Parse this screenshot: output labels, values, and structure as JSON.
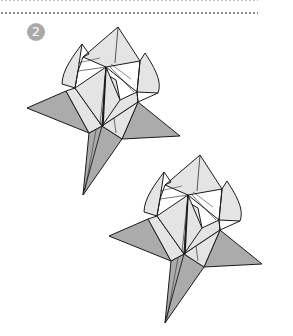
{
  "diagram": {
    "step_number": "2",
    "colors": {
      "badge": "#a9a9a9",
      "leaf": "#ababab",
      "petal": "#e4e4e4",
      "outline": "#1a1a1a"
    },
    "figures": [
      {
        "name": "origami-flower-1",
        "offset": [
          0,
          0
        ]
      },
      {
        "name": "origami-flower-2",
        "offset": [
          82,
          128
        ]
      }
    ]
  }
}
